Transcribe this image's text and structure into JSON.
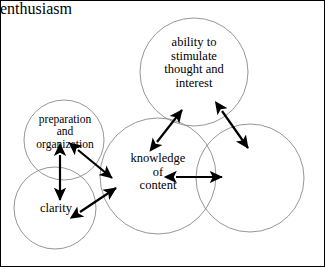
{
  "diagram": {
    "style": {
      "circle_stroke": "#8a8a8a",
      "arrow_color": "#000000",
      "frame_color": "#000000",
      "background": "#ffffff",
      "text_color": "#000000"
    },
    "circles": [
      {
        "id": "ability",
        "label": "ability to\nstimulate\nthought and\ninterest",
        "cx": 194,
        "cy": 72,
        "r": 54
      },
      {
        "id": "preparation",
        "label": "preparation\nand\norganization",
        "cx": 64,
        "cy": 140,
        "r": 40
      },
      {
        "id": "knowledge",
        "label": "knowledge\nof\ncontent",
        "cx": 158,
        "cy": 176,
        "r": 58
      },
      {
        "id": "clarity",
        "label": "clarity",
        "cx": 55,
        "cy": 208,
        "r": 41
      },
      {
        "id": "enthusiasm",
        "label": "enthusiasm",
        "cx": 250,
        "cy": 178,
        "r": 54
      }
    ],
    "arrows": [
      {
        "id": "preparation-knowledge",
        "from": "preparation",
        "to": "knowledge",
        "x1": 78,
        "y1": 150,
        "x2": 112,
        "y2": 178,
        "double_headed": true
      },
      {
        "id": "preparation-clarity",
        "from": "preparation",
        "to": "clarity",
        "x1": 60,
        "y1": 155,
        "x2": 60,
        "y2": 200,
        "double_headed": true
      },
      {
        "id": "clarity-knowledge",
        "from": "clarity",
        "to": "knowledge",
        "x1": 80,
        "y1": 212,
        "x2": 116,
        "y2": 188,
        "double_headed": true
      },
      {
        "id": "knowledge-ability",
        "from": "knowledge",
        "to": "ability",
        "x1": 157,
        "y1": 142,
        "x2": 182,
        "y2": 110,
        "double_headed": true
      },
      {
        "id": "knowledge-enthusiasm",
        "from": "knowledge",
        "to": "enthusiasm",
        "x1": 176,
        "y1": 177,
        "x2": 222,
        "y2": 177,
        "double_headed": true
      },
      {
        "id": "ability-enthusiasm",
        "from": "ability",
        "to": "enthusiasm",
        "x1": 222,
        "y1": 111,
        "x2": 248,
        "y2": 148,
        "double_headed": true
      }
    ]
  }
}
